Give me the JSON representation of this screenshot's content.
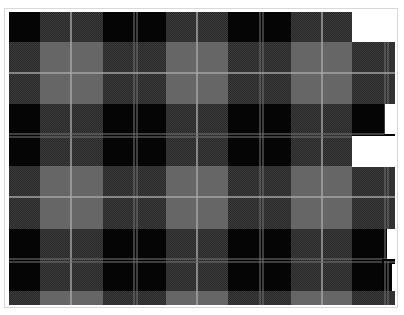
{
  "image": {
    "description": "Black and grey tartan plaid fabric pattern",
    "width": 404,
    "height": 315
  },
  "colors": {
    "black": "#050505",
    "dark_check": "#3a3a3a",
    "mid_grey": "#666666",
    "pale_line": "#aaaaaa",
    "background": "#ffffff",
    "frame_border": "#d8d8d8"
  },
  "columns": [
    {
      "x": 0,
      "w": 31,
      "band": "dark"
    },
    {
      "x": 31,
      "w": 32,
      "band": "grey"
    },
    {
      "x": 63,
      "w": 31,
      "band": "grey"
    },
    {
      "x": 94,
      "w": 32,
      "band": "dark"
    },
    {
      "x": 126,
      "w": 31,
      "band": "dark"
    },
    {
      "x": 157,
      "w": 31,
      "band": "grey"
    },
    {
      "x": 188,
      "w": 31,
      "band": "grey"
    },
    {
      "x": 219,
      "w": 32,
      "band": "dark"
    },
    {
      "x": 251,
      "w": 31,
      "band": "dark"
    },
    {
      "x": 282,
      "w": 31,
      "band": "grey"
    },
    {
      "x": 313,
      "w": 30,
      "band": "grey"
    },
    {
      "x": 343,
      "w": 43,
      "band": "dark"
    }
  ],
  "rows": [
    {
      "y": 0,
      "h": 30,
      "band": "dark"
    },
    {
      "y": 30,
      "h": 31,
      "band": "grey"
    },
    {
      "y": 61,
      "h": 31,
      "band": "grey"
    },
    {
      "y": 92,
      "h": 31,
      "band": "dark"
    },
    {
      "y": 123,
      "h": 31,
      "band": "dark"
    },
    {
      "y": 154,
      "h": 31,
      "band": "grey"
    },
    {
      "y": 185,
      "h": 32,
      "band": "grey"
    },
    {
      "y": 217,
      "h": 31,
      "band": "dark"
    },
    {
      "y": 248,
      "h": 31,
      "band": "dark"
    },
    {
      "y": 279,
      "h": 14,
      "band": "grey"
    }
  ],
  "vertical_lines": [
    {
      "x": 61,
      "style": "pale"
    },
    {
      "x": 124,
      "style": "thin"
    },
    {
      "x": 127,
      "style": "thin"
    },
    {
      "x": 187,
      "style": "pale"
    },
    {
      "x": 250,
      "style": "thin"
    },
    {
      "x": 253,
      "style": "thin"
    },
    {
      "x": 312,
      "style": "pale"
    },
    {
      "x": 375,
      "style": "thin"
    },
    {
      "x": 378,
      "style": "thin"
    }
  ],
  "horizontal_lines": [
    {
      "y": 60,
      "style": "pale"
    },
    {
      "y": 121,
      "style": "thin"
    },
    {
      "y": 124,
      "style": "thin"
    },
    {
      "y": 184,
      "style": "pale"
    },
    {
      "y": 246,
      "style": "thin"
    },
    {
      "y": 249,
      "style": "thin"
    }
  ],
  "white_patches": [
    {
      "x": 343,
      "y": -4,
      "w": 43,
      "h": 34
    },
    {
      "x": 376,
      "y": 92,
      "w": 10,
      "h": 30
    },
    {
      "x": 343,
      "y": 124,
      "w": 43,
      "h": 31
    },
    {
      "x": 378,
      "y": 217,
      "w": 8,
      "h": 31
    },
    {
      "x": 383,
      "y": 252,
      "w": 3,
      "h": 27
    }
  ],
  "edge_marks": [
    {
      "x": 375,
      "y": 122,
      "w": 11,
      "h": 2
    },
    {
      "x": 373,
      "y": 247,
      "w": 13,
      "h": 2
    },
    {
      "x": 373,
      "y": 249,
      "w": 2,
      "h": 30
    }
  ]
}
